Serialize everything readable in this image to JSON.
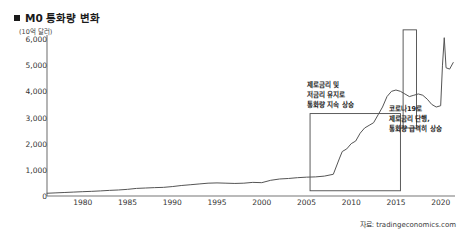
{
  "header": {
    "title": "M0 통화량 변화",
    "bullet_icon": "filled-square-icon"
  },
  "axis": {
    "unit_label": "(10억 달러)",
    "source_label": "자료: tradingeconomics.com"
  },
  "annotations": [
    {
      "id": "zero-rate-note",
      "lines": [
        "제로금리 및",
        "저금리 유지로",
        "통화량 지속 상승"
      ]
    },
    {
      "id": "covid-note",
      "lines": [
        "코로나19로",
        "제로금리 단행,",
        "통화량 급격히 상승"
      ]
    }
  ],
  "chart_data": {
    "type": "line",
    "title": "M0 통화량 변화",
    "xlabel": "",
    "ylabel": "(10억 달러)",
    "ylim": [
      0,
      6000
    ],
    "xlim": [
      1976,
      2021.6
    ],
    "grid": false,
    "legend": null,
    "yticks": [
      0,
      1000,
      2000,
      3000,
      4000,
      5000,
      6000
    ],
    "ytick_labels": [
      "0",
      "1,000",
      "2,000",
      "3,000",
      "4,000",
      "5,000",
      "6,000"
    ],
    "xticks": [
      1980,
      1985,
      1990,
      1995,
      2000,
      2005,
      2010,
      2015,
      2020
    ],
    "xtick_labels": [
      "1980",
      "1985",
      "1990",
      "1995",
      "2000",
      "2005",
      "2010",
      "2015",
      "2020"
    ],
    "series": [
      {
        "name": "M0",
        "color": "#555555",
        "x": [
          1976,
          1977,
          1978,
          1979,
          1980,
          1981,
          1982,
          1983,
          1984,
          1985,
          1986,
          1987,
          1988,
          1989,
          1990,
          1991,
          1992,
          1993,
          1994,
          1995,
          1996,
          1997,
          1998,
          1999,
          2000,
          2001,
          2002,
          2003,
          2004,
          2005,
          2006,
          2007,
          2008,
          2008.7,
          2009,
          2009.5,
          2010,
          2010.5,
          2011,
          2011.5,
          2012,
          2012.5,
          2013,
          2013.5,
          2014,
          2014.5,
          2015,
          2015.5,
          2016,
          2016.5,
          2017,
          2017.5,
          2018,
          2018.5,
          2019,
          2019.5,
          2020,
          2020.2,
          2020.4,
          2020.6,
          2021,
          2021.4
        ],
        "y": [
          105,
          120,
          135,
          150,
          165,
          178,
          195,
          215,
          230,
          255,
          290,
          305,
          320,
          330,
          360,
          400,
          430,
          460,
          490,
          500,
          490,
          480,
          490,
          520,
          510,
          600,
          650,
          670,
          700,
          720,
          730,
          760,
          830,
          1450,
          1700,
          1800,
          2000,
          2100,
          2400,
          2600,
          2700,
          2800,
          3100,
          3400,
          3800,
          4000,
          4050,
          4000,
          3900,
          3800,
          3850,
          3900,
          3850,
          3700,
          3500,
          3400,
          3450,
          5000,
          6050,
          4900,
          4850,
          5100
        ]
      }
    ],
    "callout_boxes": [
      {
        "name": "zero-rate-box",
        "x0": 2005.4,
        "x1": 2015.5,
        "y0": 200,
        "y1": 3150
      },
      {
        "name": "covid-box",
        "x0": 2015.8,
        "x1": 2017.3,
        "y0": 2600,
        "y1": 6350
      }
    ]
  }
}
